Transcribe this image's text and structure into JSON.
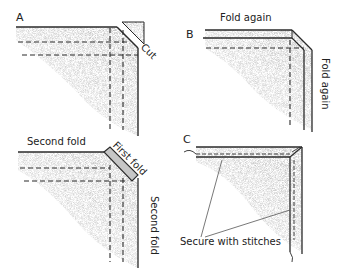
{
  "diagram": {
    "colors": {
      "line": "#2a2a2a",
      "fabric": "#bdbdbd",
      "fabric_dark": "#8e8e8e",
      "background": "#ffffff"
    },
    "panels": [
      {
        "id": "A",
        "letter": "A",
        "labels": {
          "cut": "Cut"
        }
      },
      {
        "id": "B",
        "letter": "B",
        "labels": {
          "top": "Fold again",
          "side": "Fold again"
        }
      },
      {
        "id": "A2",
        "letter": "",
        "labels": {
          "top": "Second fold",
          "diagonal": "First fold",
          "side": "Second fold"
        }
      },
      {
        "id": "C",
        "letter": "C",
        "labels": {
          "callout": "Secure with stitches"
        }
      }
    ]
  }
}
